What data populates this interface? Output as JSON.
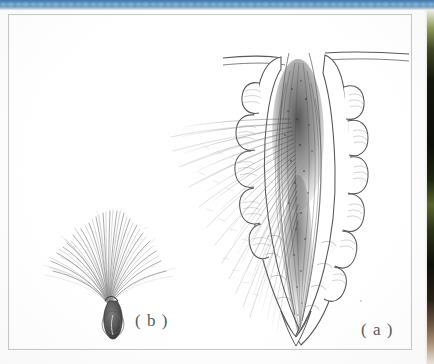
{
  "page": {
    "kind": "scanned-book-page",
    "background_color": "#fdfdfd"
  },
  "header_band": {
    "name": "blurred-blue-header-band",
    "color_start": "#3f7bb0",
    "color_end": "#e8eff5",
    "height_px": 10,
    "text": ""
  },
  "photo_sliver": {
    "name": "adjacent-photo-edge",
    "description": "narrow vertical sliver of a dark green photograph bleeding in from the facing page",
    "dominant_colors": [
      "#8d9a5c",
      "#11140a",
      "#57632e",
      "#6d5542"
    ]
  },
  "figure": {
    "frame_border_color": "#c9c9c9",
    "background_color": "#ffffff",
    "ink_color": "#4a4a4a",
    "panels": [
      {
        "id": "a",
        "label": "( a )",
        "name": "panel-a-bract-with-seeds",
        "description": "Pen-and-ink drawing of an elongated lance-shaped bract or follicle attached to a horizontal stem, split open to reveal a dense mass of plumed seeds with long silky hairs spilling out to the left."
      },
      {
        "id": "b",
        "label": "( b )",
        "name": "panel-b-plumed-seed",
        "description": "Pen-and-ink drawing of a single seed with an ovoid textured body and a fan of radiating pappus bristles forming a parachute."
      }
    ]
  }
}
